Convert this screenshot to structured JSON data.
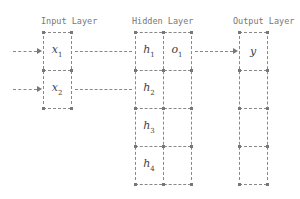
{
  "diagram": {
    "layers": [
      {
        "name": "Input Layer",
        "cells": [
          {
            "symbol": "x",
            "sub": "1"
          },
          {
            "symbol": "x",
            "sub": "2"
          }
        ]
      },
      {
        "name": "Hidden Layer",
        "cells": [
          {
            "symbol": "h",
            "sub": "1"
          },
          {
            "symbol": "h",
            "sub": "2"
          },
          {
            "symbol": "h",
            "sub": "3"
          },
          {
            "symbol": "h",
            "sub": "4"
          }
        ],
        "side_cells": [
          {
            "symbol": "o",
            "sub": "1"
          }
        ]
      },
      {
        "name": "Output Layer",
        "cells": [
          {
            "symbol": "y",
            "sub": ""
          }
        ]
      }
    ],
    "titles": {
      "input": "Input Layer",
      "hidden": "Hidden Layer",
      "output": "Output Layer"
    },
    "labels": {
      "x1": "x",
      "x1_sub": "1",
      "x2": "x",
      "x2_sub": "2",
      "h1": "h",
      "h1_sub": "1",
      "o1": "o",
      "o1_sub": "1",
      "h2": "h",
      "h2_sub": "2",
      "h3": "h",
      "h3_sub": "3",
      "h4": "h",
      "h4_sub": "4",
      "y": "y"
    },
    "connections": [
      {
        "from": "external",
        "to": "x1"
      },
      {
        "from": "external",
        "to": "x2"
      },
      {
        "from": "x1",
        "to": "h1"
      },
      {
        "from": "x2",
        "to": "h2"
      },
      {
        "from": "o1",
        "to": "y"
      }
    ]
  }
}
